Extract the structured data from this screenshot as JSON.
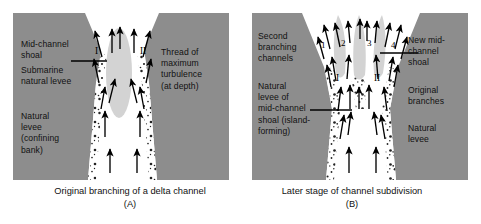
{
  "figure": {
    "background": "#ffffff",
    "panel_fill": "#8d8d8d",
    "channel_fill": "#ffffff",
    "shoal_fill": "#d3d3d3",
    "arrow_color": "#000000",
    "text_color": "#111111"
  },
  "panel_a": {
    "labels": {
      "mid_channel_shoal": "Mid-channel\nshoal",
      "submarine_natural_levee": "Submarine\nnatural levee",
      "natural_levee_confining": "Natural\nlevee\n(confining\nbank)",
      "thread_max_turbulence": "Thread of\nmaximum\nturbulence\n(at depth)"
    },
    "channel_marks": [
      {
        "id": "I",
        "label": "I"
      },
      {
        "id": "II",
        "label": "II"
      }
    ]
  },
  "panel_b": {
    "labels": {
      "second_branching_channels": "Second\nbranching\nchannels",
      "natural_levee_of_mid_channel_shoal": "Natural\nlevee of\nmid-channel\nshoal (island-\nforming)",
      "new_mid_channel_shoal": "New mid-\nchannel\nshoal",
      "original_branches": "Original\nbranches",
      "natural_levee": "Natural\nlevee"
    },
    "channel_numbers": [
      {
        "id": "1",
        "label": "1"
      },
      {
        "id": "2",
        "label": "2"
      },
      {
        "id": "3",
        "label": "3"
      },
      {
        "id": "4",
        "label": "4"
      }
    ],
    "channel_marks": [
      {
        "id": "I",
        "label": "I"
      },
      {
        "id": "II",
        "label": "II"
      }
    ]
  },
  "captions": {
    "a_text": "Original branching of a delta channel",
    "a_letter": "(A)",
    "b_text": "Later stage of channel subdivision",
    "b_letter": "(B)"
  }
}
